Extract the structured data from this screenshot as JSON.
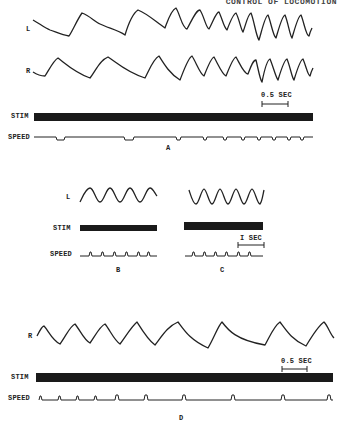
{
  "header": {
    "running_title": "CONTROL OF LOCOMOTION"
  },
  "panels": {
    "A": {
      "letter": "A",
      "trace_labels": {
        "left": "L",
        "right": "R",
        "stim": "STIM",
        "speed": "SPEED"
      },
      "scale_bar": "0.5 SEC"
    },
    "B": {
      "letter": "B",
      "trace_labels": {
        "left": "L",
        "stim": "STIM",
        "speed": "SPEED"
      }
    },
    "C": {
      "letter": "C",
      "scale_bar": "I SEC"
    },
    "D": {
      "letter": "D",
      "trace_labels": {
        "right": "R",
        "stim": "STIM",
        "speed": "SPEED"
      },
      "scale_bar": "0.5 SEC"
    }
  },
  "colors": {
    "ink": "#222222",
    "paper": "#ffffff"
  }
}
